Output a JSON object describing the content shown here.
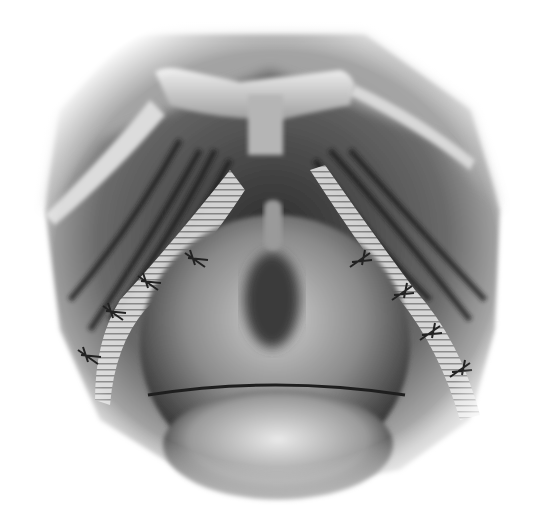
{
  "image": {
    "kind": "grayscale anatomical surgical illustration",
    "palette": {
      "background": "#ffffff",
      "surround": "#a9a9a9",
      "dark": "#1c1c1c",
      "mid": "#6e6e6e",
      "light": "#e4e4e4"
    },
    "sutures": {
      "left": [
        [
          195,
          260
        ],
        [
          148,
          283
        ],
        [
          113,
          313
        ],
        [
          88,
          357
        ]
      ],
      "right": [
        [
          360,
          260
        ],
        [
          402,
          293
        ],
        [
          430,
          333
        ],
        [
          460,
          370
        ]
      ]
    }
  }
}
